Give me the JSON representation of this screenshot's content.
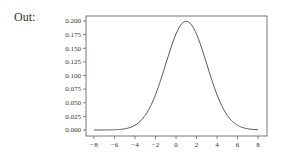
{
  "prompt": {
    "label": "Out:"
  },
  "chart_data": {
    "type": "line",
    "title": "",
    "xlabel": "",
    "ylabel": "",
    "xlim": [
      -8.5,
      8.5
    ],
    "ylim": [
      -0.01,
      0.21
    ],
    "xticks": [
      -8,
      -6,
      -4,
      -2,
      0,
      2,
      4,
      6,
      8
    ],
    "yticks": [
      0.0,
      0.025,
      0.05,
      0.075,
      0.1,
      0.125,
      0.15,
      0.175,
      0.2
    ],
    "ytick_labels": [
      "0.000",
      "0.025",
      "0.050",
      "0.075",
      "0.100",
      "0.125",
      "0.150",
      "0.175",
      "0.200"
    ],
    "xtick_labels": [
      "−8",
      "−6",
      "−4",
      "−2",
      "0",
      "2",
      "4",
      "6",
      "8"
    ],
    "grid": false,
    "legend": null,
    "series": [
      {
        "name": "normal pdf (mean=1, std=2)",
        "color": "#555555",
        "x": [
          -8,
          -7,
          -6,
          -5,
          -4,
          -3,
          -2,
          -1,
          0,
          1,
          2,
          3,
          4,
          5,
          6,
          7,
          8
        ],
        "y": [
          0.0001,
          0.0007,
          0.0044,
          0.0022,
          0.0088,
          0.027,
          0.0648,
          0.121,
          0.176,
          0.1995,
          0.176,
          0.121,
          0.0648,
          0.027,
          0.0088,
          0.0022,
          0.0004
        ]
      }
    ]
  }
}
